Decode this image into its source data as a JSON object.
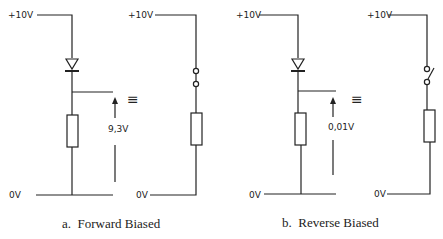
{
  "figure": {
    "panels": [
      {
        "id": "a",
        "caption": "a.  Forward Biased",
        "diode_circuit": {
          "supply_label": "+10V",
          "ground_label": "0V",
          "output_voltage_label": "9,3V"
        },
        "equivalent_symbol": "≡",
        "switch_circuit": {
          "supply_label": "+10V",
          "ground_label": "0V",
          "switch_state": "closed"
        }
      },
      {
        "id": "b",
        "caption": "b.  Reverse Biased",
        "diode_circuit": {
          "supply_label": "+10V",
          "ground_label": "0V",
          "output_voltage_label": "0,01V"
        },
        "equivalent_symbol": "≡",
        "switch_circuit": {
          "supply_label": "+10V",
          "ground_label": "0V",
          "switch_state": "open"
        }
      }
    ]
  }
}
